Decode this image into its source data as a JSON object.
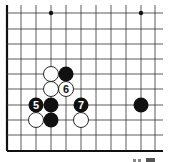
{
  "diagram": {
    "type": "go-board-fragment",
    "grid": {
      "x_lines": [
        7,
        21,
        36,
        51,
        66,
        81,
        96,
        111,
        126,
        141,
        155
      ],
      "y_lines": [
        13,
        29,
        44,
        59,
        74,
        89,
        105,
        120,
        135,
        151
      ],
      "right_edge": 163,
      "top_edge": 5,
      "left_edge_thick": true,
      "bottom_edge_thick": true,
      "line_color": "#333333",
      "edge_color": "#111111"
    },
    "star_points": [
      {
        "col": 3,
        "row": 0
      },
      {
        "col": 9,
        "row": 0
      }
    ],
    "stones": [
      {
        "color": "white",
        "col": 3,
        "row": 4,
        "label": ""
      },
      {
        "color": "black",
        "col": 4,
        "row": 4,
        "label": ""
      },
      {
        "color": "white",
        "col": 3,
        "row": 5,
        "label": ""
      },
      {
        "color": "white",
        "col": 4,
        "row": 5,
        "label": "6"
      },
      {
        "color": "black",
        "col": 2,
        "row": 6,
        "label": "5"
      },
      {
        "color": "black",
        "col": 3,
        "row": 6,
        "label": ""
      },
      {
        "color": "black",
        "col": 5,
        "row": 6,
        "label": "7"
      },
      {
        "color": "black",
        "col": 9,
        "row": 6,
        "label": ""
      },
      {
        "color": "white",
        "col": 2,
        "row": 7,
        "label": ""
      },
      {
        "color": "black",
        "col": 3,
        "row": 7,
        "label": ""
      },
      {
        "color": "white",
        "col": 5,
        "row": 7,
        "label": ""
      }
    ],
    "stone_radius": 7.5,
    "colors": {
      "black_stone": "#111111",
      "white_stone": "#ffffff",
      "stone_outline": "#111111"
    }
  }
}
